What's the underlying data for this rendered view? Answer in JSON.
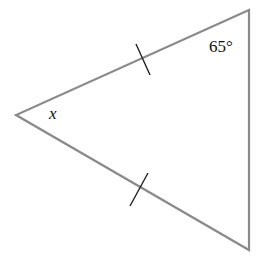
{
  "diagram": {
    "type": "isosceles-triangle",
    "vertices": {
      "top_right": [
        249,
        10
      ],
      "left": [
        16,
        115
      ],
      "bottom_right": [
        249,
        250
      ]
    },
    "labels": {
      "top_angle": "65°",
      "left_angle": "x"
    },
    "congruence_marks": [
      {
        "side": "left-to-top",
        "count": 1
      },
      {
        "side": "left-to-bottom",
        "count": 1
      }
    ],
    "colors": {
      "edge": "#8a8a8a",
      "tick": "#222222",
      "text": "#111111"
    }
  }
}
